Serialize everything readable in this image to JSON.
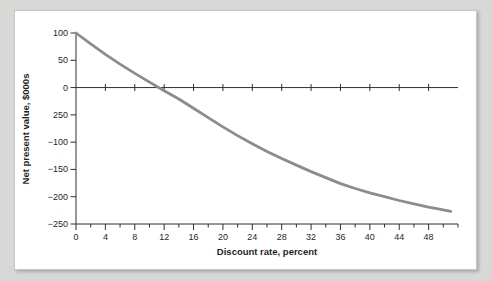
{
  "figure": {
    "description": "Net present value profile versus discount rate"
  },
  "colors": {
    "background": "#d8d8d6",
    "card": "#ffffff",
    "card_border": "#c6c6c6",
    "axis": "#2f2f2f",
    "curve": "#8c8c8c",
    "text": "#1f1f1f"
  },
  "chart_data": {
    "type": "line",
    "title": "",
    "xlabel": "Discount rate, percent",
    "ylabel": "Net present value, $000s",
    "xlim": [
      0,
      52
    ],
    "ylim": [
      -250,
      100
    ],
    "grid": false,
    "legend": "none",
    "zero_line": true,
    "x_major_ticks": [
      0,
      4,
      8,
      12,
      16,
      20,
      24,
      28,
      32,
      36,
      40,
      44,
      48
    ],
    "x_tick_labels": [
      "0",
      "4",
      "8",
      "12",
      "16",
      "20",
      "24",
      "28",
      "32",
      "36",
      "40",
      "44",
      "48"
    ],
    "x_minor_ticks": [
      2,
      6,
      10,
      14,
      18,
      22,
      26,
      30,
      34,
      38,
      42,
      46,
      50,
      52
    ],
    "zero_line_cross_ticks": [
      4,
      8,
      12,
      16,
      20,
      24,
      28,
      32,
      36,
      40,
      44,
      48
    ],
    "y_ticks": [
      100,
      50,
      0,
      -50,
      -100,
      -150,
      -200,
      -250
    ],
    "y_tick_labels": [
      "100",
      "50",
      "0",
      "250",
      "−100",
      "−150",
      "−200",
      "−250"
    ],
    "series": [
      {
        "name": "NPV profile",
        "color": "#8c8c8c",
        "stroke_width": 2.8,
        "points": [
          [
            0,
            100
          ],
          [
            2,
            80
          ],
          [
            4,
            61
          ],
          [
            6,
            43
          ],
          [
            8,
            26
          ],
          [
            10,
            10
          ],
          [
            12,
            -6
          ],
          [
            14,
            -21
          ],
          [
            16,
            -38
          ],
          [
            18,
            -55
          ],
          [
            20,
            -72
          ],
          [
            22,
            -88
          ],
          [
            24,
            -103
          ],
          [
            26,
            -117
          ],
          [
            28,
            -130
          ],
          [
            30,
            -142
          ],
          [
            32,
            -154
          ],
          [
            34,
            -165
          ],
          [
            36,
            -176
          ],
          [
            38,
            -185
          ],
          [
            40,
            -193
          ],
          [
            42,
            -200
          ],
          [
            44,
            -207
          ],
          [
            46,
            -213
          ],
          [
            48,
            -219
          ],
          [
            50,
            -224
          ],
          [
            51,
            -227
          ]
        ]
      }
    ]
  }
}
